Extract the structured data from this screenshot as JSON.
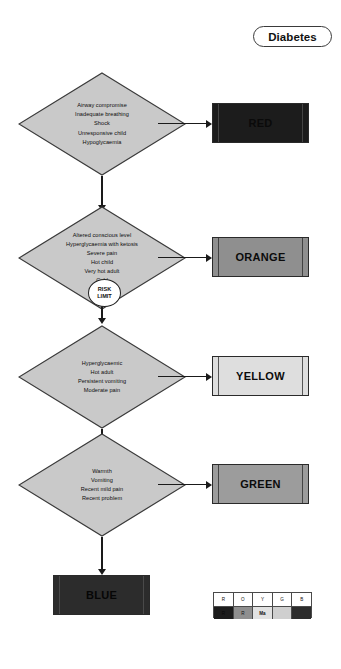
{
  "title": {
    "label": "Diabetes"
  },
  "flow": {
    "nodes": [
      {
        "id": "red-criteria",
        "lines": [
          "Airway compromise",
          "Inadequate breathing",
          "Shock",
          "Unresponsive child",
          "Hypoglycaemia"
        ]
      },
      {
        "id": "orange-criteria",
        "lines": [
          "Altered conscious level",
          "Hyperglycaemia with ketosis",
          "Severe pain",
          "Hot child",
          "Very hot adult",
          "Cold"
        ]
      },
      {
        "id": "yellow-criteria",
        "lines": [
          "Hyperglycaemic",
          "Hot adult",
          "Persistent vomiting",
          "Moderate pain"
        ]
      },
      {
        "id": "green-criteria",
        "lines": [
          "Warmth",
          "Vomiting",
          "Recent mild pain",
          "Recent problem"
        ]
      }
    ],
    "risk_limit": {
      "line1": "RISK",
      "line2": "LIMIT"
    },
    "outcomes": [
      {
        "id": "red",
        "label": "RED",
        "color": "#1c1c1c"
      },
      {
        "id": "orange",
        "label": "ORANGE",
        "color": "#8f8f8f"
      },
      {
        "id": "yellow",
        "label": "YELLOW",
        "color": "#dedede"
      },
      {
        "id": "green",
        "label": "GREEN",
        "color": "#9c9c9c"
      },
      {
        "id": "blue",
        "label": "BLUE",
        "color": "#2c2c2c"
      }
    ]
  },
  "legend": {
    "headers": [
      "R",
      "O",
      "Y",
      "G",
      "B"
    ],
    "swatch_labels": [
      "R",
      "R",
      "Ma",
      "",
      ""
    ]
  }
}
